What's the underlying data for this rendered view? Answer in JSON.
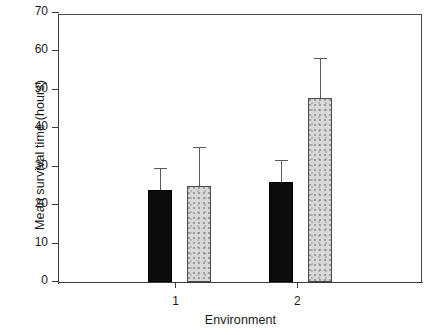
{
  "chart_data": {
    "type": "bar",
    "title": "",
    "xlabel": "Environment",
    "ylabel": "Mean survival time (hours)",
    "categories": [
      "1",
      "2"
    ],
    "xtick_labels": [
      "1",
      "2"
    ],
    "ytick_labels": [
      "0",
      "10",
      "20",
      "30",
      "40",
      "50",
      "60",
      "70"
    ],
    "yticks": [
      0,
      10,
      20,
      30,
      40,
      50,
      60,
      70
    ],
    "ylim": [
      0,
      70
    ],
    "grid": false,
    "legend": "none",
    "error_bar_type": "upper-only",
    "series": [
      {
        "name": "black",
        "fill": "#0d0d0d",
        "values": [
          24,
          26
        ],
        "errors": [
          5.5,
          5.5
        ],
        "upper_bounds": [
          29.5,
          31.5
        ]
      },
      {
        "name": "grey",
        "fill": "#d8d8d8",
        "values": [
          25,
          48
        ],
        "errors": [
          10,
          10
        ],
        "upper_bounds": [
          35,
          58
        ]
      }
    ]
  },
  "axes": {
    "ylabel": "Mean survival time (hours)",
    "xlabel": "Environment"
  },
  "yticks": [
    {
      "value": 70,
      "label": "70"
    },
    {
      "value": 60,
      "label": "60"
    },
    {
      "value": 50,
      "label": "50"
    },
    {
      "value": 40,
      "label": "40"
    },
    {
      "value": 30,
      "label": "30"
    },
    {
      "value": 20,
      "label": "20"
    },
    {
      "value": 10,
      "label": "10"
    },
    {
      "value": 0,
      "label": "0"
    }
  ],
  "xticks": [
    {
      "pos": 0.32,
      "label": "1"
    },
    {
      "pos": 0.655,
      "label": "2"
    }
  ],
  "bars": [
    {
      "name": "bar-env1-black",
      "group": "1",
      "series": "black",
      "value": 24,
      "error": 5.5,
      "fill": "black",
      "left": 89,
      "width": 24
    },
    {
      "name": "bar-env1-grey",
      "group": "1",
      "series": "grey",
      "value": 25,
      "error": 10,
      "fill": "grey",
      "left": 128,
      "width": 24
    },
    {
      "name": "bar-env2-black",
      "group": "2",
      "series": "black",
      "value": 26,
      "error": 5.5,
      "fill": "black",
      "left": 210,
      "width": 24
    },
    {
      "name": "bar-env2-grey",
      "group": "2",
      "series": "grey",
      "value": 48,
      "error": 10,
      "fill": "grey",
      "left": 249,
      "width": 24
    }
  ]
}
